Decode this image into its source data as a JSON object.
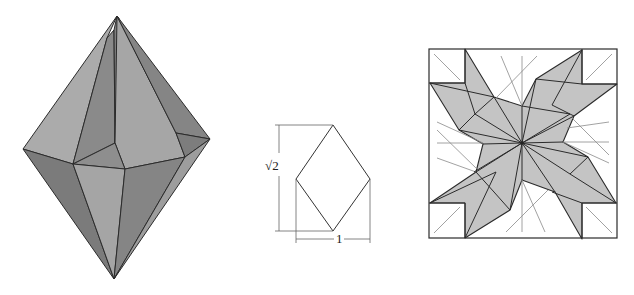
{
  "figure": {
    "panels": [
      {
        "name": "polyhedron",
        "description": "Folded origami bipyramid-like solid"
      },
      {
        "name": "rhombus-diagram",
        "description": "Rhombus with dimension lines"
      },
      {
        "name": "crease-pattern",
        "description": "Square crease pattern with shaded star region"
      }
    ],
    "dimensions": {
      "height_label": "√2",
      "width_label": "1"
    },
    "colors": {
      "face_light": "#a9a9a9",
      "face_mid": "#919191",
      "face_dark": "#7b7b7b",
      "shade": "#c4c4c4",
      "line": "#2b2b2b",
      "thin_line": "#8a8a8a"
    }
  }
}
